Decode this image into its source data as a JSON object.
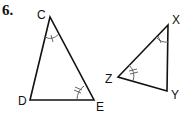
{
  "problem": {
    "number": "6."
  },
  "triangle_1": {
    "vertices": [
      {
        "name": "C",
        "x": 50,
        "y": 17,
        "label_x": 37,
        "label_y": 9
      },
      {
        "name": "D",
        "x": 30,
        "y": 100,
        "label_x": 18,
        "label_y": 95
      },
      {
        "name": "E",
        "x": 94,
        "y": 100,
        "label_x": 96,
        "label_y": 101
      }
    ],
    "angle_marks": [
      {
        "vertex": "C",
        "arcs": 1,
        "ticks": 1
      },
      {
        "vertex": "E",
        "arcs": 1,
        "ticks": 2
      }
    ]
  },
  "triangle_2": {
    "vertices": [
      {
        "name": "X",
        "x": 168,
        "y": 25,
        "label_x": 172,
        "label_y": 14
      },
      {
        "name": "Z",
        "x": 118,
        "y": 77,
        "label_x": 105,
        "label_y": 73
      },
      {
        "name": "Y",
        "x": 167,
        "y": 91,
        "label_x": 171,
        "label_y": 89
      }
    ],
    "angle_marks": [
      {
        "vertex": "X",
        "arcs": 1,
        "ticks": 1
      },
      {
        "vertex": "Z",
        "arcs": 1,
        "ticks": 2
      }
    ]
  },
  "colors": {
    "line": "#111111",
    "mark": "#555555"
  }
}
